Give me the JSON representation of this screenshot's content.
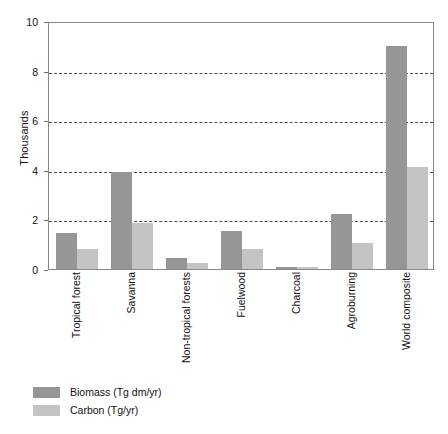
{
  "chart_data": {
    "type": "bar",
    "title": "",
    "subtitle": "",
    "xlabel": "",
    "ylabel": "Thousands",
    "ylim": [
      0,
      10
    ],
    "yticks": [
      0,
      2,
      4,
      6,
      8,
      10
    ],
    "ytick_labels": [
      "0",
      "2",
      "4",
      "6",
      "8",
      "10"
    ],
    "gridlines": [
      2,
      4,
      6,
      8
    ],
    "grid": "horizontal-dashed",
    "legend_position": "below-left",
    "categories": [
      "Tropical forest",
      "Savanna",
      "Non-tropical forests",
      "Fuelwood",
      "Charcoal",
      "Agroburning",
      "World composite"
    ],
    "series": [
      {
        "name": "Biomass (Tg dm/yr)",
        "color": "#969696",
        "values": [
          1.45,
          3.9,
          0.45,
          1.55,
          0.1,
          2.2,
          9.0
        ]
      },
      {
        "name": "Carbon (Tg/yr)",
        "color": "#c4c4c4",
        "values": [
          0.8,
          1.85,
          0.25,
          0.8,
          0.07,
          1.05,
          4.1
        ]
      }
    ]
  },
  "legend": {
    "items": [
      {
        "label": "Biomass (Tg dm/yr)",
        "swatch": "biomass"
      },
      {
        "label": "Carbon (Tg/yr)",
        "swatch": "carbon"
      }
    ]
  },
  "colors": {
    "biomass": "#969696",
    "carbon": "#c4c4c4",
    "plot_border": "#888888",
    "gridline": "#4a4a4a",
    "text": "#111111",
    "background": "#ffffff"
  }
}
